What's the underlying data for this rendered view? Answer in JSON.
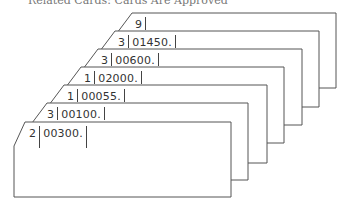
{
  "caption_partial": "Related Cards: Cards Are Approved",
  "colors": {
    "stroke": "#555555",
    "text": "#333333",
    "background": "#ffffff"
  },
  "cards": [
    {
      "field1": "9",
      "field2": ""
    },
    {
      "field1": "3",
      "field2": "01450."
    },
    {
      "field1": "3",
      "field2": "00600."
    },
    {
      "field1": "1",
      "field2": "02000."
    },
    {
      "field1": "1",
      "field2": "00055."
    },
    {
      "field1": "3",
      "field2": "00100."
    },
    {
      "field1": "2",
      "field2": "00300."
    }
  ]
}
